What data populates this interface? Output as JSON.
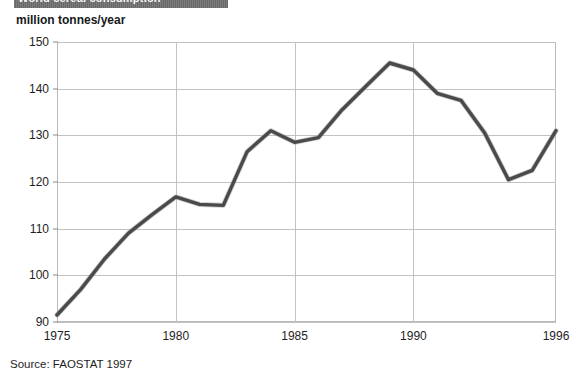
{
  "title_band": {
    "text": "World cereal consumption",
    "background_color": "#6e6e6e",
    "text_color": "#ffffff"
  },
  "unit_label": "million tonnes/year",
  "source_note": "Source: FAOSTAT 1997",
  "axis": {
    "y_ticks": [
      "150",
      "140",
      "130",
      "120",
      "110",
      "100",
      "90"
    ],
    "x_ticks": [
      "1975",
      "1980",
      "1985",
      "1990",
      "1996"
    ]
  },
  "chart_data": {
    "type": "line",
    "title": "World cereal consumption",
    "subtitle": "",
    "xlabel": "",
    "ylabel": "million tonnes/year",
    "xlim": [
      1975,
      1996
    ],
    "ylim": [
      90,
      150
    ],
    "yticks": [
      90,
      100,
      110,
      120,
      130,
      140,
      150
    ],
    "xticks": [
      1975,
      1980,
      1985,
      1990,
      1996
    ],
    "grid": true,
    "legend": "none",
    "annotations": [
      "Source: FAOSTAT 1997"
    ],
    "line_color": "#4a4a4a",
    "x": [
      1975,
      1976,
      1977,
      1978,
      1979,
      1980,
      1981,
      1982,
      1983,
      1984,
      1985,
      1986,
      1987,
      1988,
      1989,
      1990,
      1991,
      1992,
      1993,
      1994,
      1995,
      1996
    ],
    "values": [
      91.5,
      97.0,
      103.5,
      109.0,
      113.0,
      116.8,
      115.2,
      115.0,
      126.5,
      131.0,
      128.5,
      129.5,
      135.5,
      140.5,
      145.5,
      144.0,
      139.0,
      137.5,
      130.5,
      120.5,
      122.5,
      131.0
    ],
    "series": [
      {
        "name": "World cereal consumption",
        "values": [
          91.5,
          97.0,
          103.5,
          109.0,
          113.0,
          116.8,
          115.2,
          115.0,
          126.5,
          131.0,
          128.5,
          129.5,
          135.5,
          140.5,
          145.5,
          144.0,
          139.0,
          137.5,
          130.5,
          120.5,
          122.5,
          131.0
        ]
      }
    ]
  }
}
